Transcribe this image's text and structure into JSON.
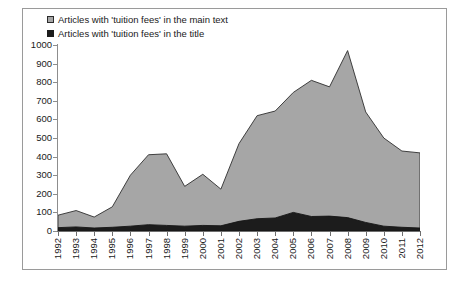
{
  "chart_data": {
    "type": "area",
    "stacked": true,
    "title": "",
    "subtitle": "",
    "xlabel": "",
    "ylabel": "",
    "grid": false,
    "legend_position": "top-left",
    "categories": [
      "1992",
      "1993",
      "1994",
      "1995",
      "1996",
      "1997",
      "1998",
      "1999",
      "2000",
      "2001",
      "2002",
      "2003",
      "2004",
      "2005",
      "2006",
      "2007",
      "2008",
      "2009",
      "2010",
      "2011",
      "2012"
    ],
    "series": [
      {
        "name": "Articles with 'tuition fees' in the main text",
        "color": "#a6a6a6",
        "values": [
          85,
          110,
          75,
          130,
          300,
          410,
          415,
          240,
          305,
          225,
          470,
          620,
          645,
          745,
          810,
          775,
          970,
          640,
          500,
          430,
          420
        ]
      },
      {
        "name": "Articles with 'tuition fees' in the title",
        "color": "#1c1c1c",
        "values": [
          18,
          22,
          16,
          20,
          26,
          34,
          30,
          26,
          30,
          28,
          52,
          66,
          70,
          100,
          78,
          80,
          72,
          46,
          26,
          20,
          16
        ]
      }
    ],
    "xlim": [
      "1992",
      "2012"
    ],
    "ylim": [
      0,
      1000
    ],
    "ytick_values": [
      0,
      100,
      200,
      300,
      400,
      500,
      600,
      700,
      800,
      900,
      1000
    ],
    "ytick_labels": [
      "0",
      "100",
      "200",
      "300",
      "400",
      "500",
      "600",
      "700",
      "800",
      "900",
      "1000"
    ]
  },
  "legend": {
    "items": [
      {
        "label": "Articles with 'tuition fees' in the main text",
        "swatch": "gray",
        "color": "#a6a6a6"
      },
      {
        "label": "Articles with 'tuition fees' in the title",
        "swatch": "black",
        "color": "#1c1c1c"
      }
    ]
  }
}
